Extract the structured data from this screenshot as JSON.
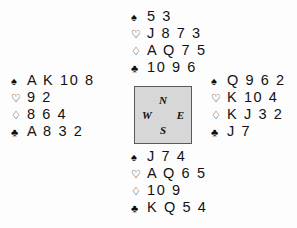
{
  "diagram": {
    "type": "bridge-hand-diagram",
    "background_color": "#fdfdfd",
    "text_color": "#121212",
    "suits": [
      {
        "key": "spades",
        "glyph": "♠",
        "name": "spade-symbol",
        "filled": true
      },
      {
        "key": "hearts",
        "glyph": "♡",
        "name": "heart-symbol",
        "filled": false
      },
      {
        "key": "diamonds",
        "glyph": "♢",
        "name": "diamond-symbol",
        "filled": false
      },
      {
        "key": "clubs",
        "glyph": "♣",
        "name": "club-symbol",
        "filled": true
      }
    ]
  },
  "compass": {
    "fill_color": "#d7d7d7",
    "border_color": "#5a5a5a",
    "north": "N",
    "south": "S",
    "west": "W",
    "east": "E"
  },
  "hands": {
    "north": {
      "label": "North",
      "spades": "5 3",
      "hearts": "J 8 7 3",
      "diamonds": "A Q 7 5",
      "clubs": "10 9 6"
    },
    "west": {
      "label": "West",
      "spades": "A K 10 8",
      "hearts": "9 2",
      "diamonds": "8 6 4",
      "clubs": "A 8 3 2"
    },
    "east": {
      "label": "East",
      "spades": "Q 9 6 2",
      "hearts": "K 10 4",
      "diamonds": "K J 3 2",
      "clubs": "J 7"
    },
    "south": {
      "label": "South",
      "spades": "J 7 4",
      "hearts": "A Q 6 5",
      "diamonds": "10 9",
      "clubs": "K Q 5 4"
    }
  }
}
